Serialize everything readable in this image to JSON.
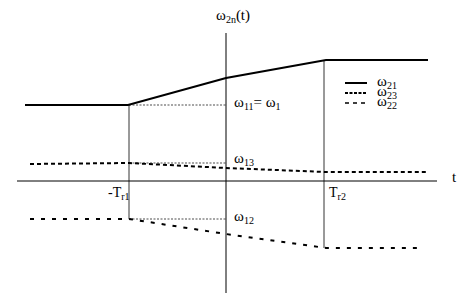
{
  "diagram": {
    "y_axis_label": {
      "main": "ω",
      "sub": "2n",
      "suffix": "(t)"
    },
    "x_axis_label": "t",
    "ticks": [
      {
        "main": "-T",
        "sub": "r1"
      },
      {
        "main": "T",
        "sub": "r2"
      }
    ],
    "annotations": [
      {
        "main": "ω",
        "sub": "11",
        "mid": "= ω",
        "sub2": "1"
      },
      {
        "main": "ω",
        "sub": "13"
      },
      {
        "main": "ω",
        "sub": "12"
      }
    ],
    "legend": [
      {
        "main": "ω",
        "sub": "21",
        "style": "solid"
      },
      {
        "main": "ω",
        "sub": "23",
        "style": "dense-dashed"
      },
      {
        "main": "ω",
        "sub": "22",
        "style": "dashed"
      }
    ],
    "series": {
      "omega21": {
        "style": "solid",
        "points": [
          [
            25,
            105
          ],
          [
            128,
            105
          ],
          [
            226,
            78
          ],
          [
            326,
            60
          ],
          [
            428,
            60
          ]
        ]
      },
      "omega23": {
        "style": "dense-dashed",
        "points": [
          [
            30,
            164
          ],
          [
            129,
            163
          ],
          [
            226,
            168
          ],
          [
            326,
            172
          ],
          [
            428,
            172
          ]
        ]
      },
      "omega22": {
        "style": "dashed",
        "points": [
          [
            30,
            219
          ],
          [
            129,
            219
          ],
          [
            226,
            234
          ],
          [
            326,
            248
          ],
          [
            422,
            248
          ]
        ]
      }
    }
  }
}
